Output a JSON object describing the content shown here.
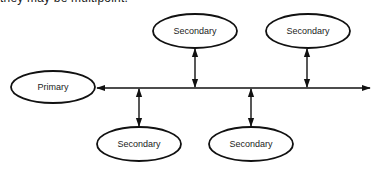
{
  "caption": "they may be multipoint.",
  "nodes": {
    "primary": {
      "label": "Primary",
      "cx": 53,
      "cy": 87,
      "rx": 42,
      "ry": 16
    },
    "secondary_top_left": {
      "label": "Secondary",
      "cx": 195,
      "cy": 31,
      "rx": 42,
      "ry": 17
    },
    "secondary_top_right": {
      "label": "Secondary",
      "cx": 308,
      "cy": 31,
      "rx": 42,
      "ry": 17
    },
    "secondary_bottom_left": {
      "label": "Secondary",
      "cx": 139,
      "cy": 144,
      "rx": 42,
      "ry": 17
    },
    "secondary_bottom_right": {
      "label": "Secondary",
      "cx": 251,
      "cy": 144,
      "rx": 42,
      "ry": 17
    }
  },
  "bus": {
    "y": 88,
    "x_start": 97,
    "x_end": 370
  },
  "colors": {
    "stroke": "#111111",
    "text": "#222222",
    "background": "#ffffff"
  }
}
